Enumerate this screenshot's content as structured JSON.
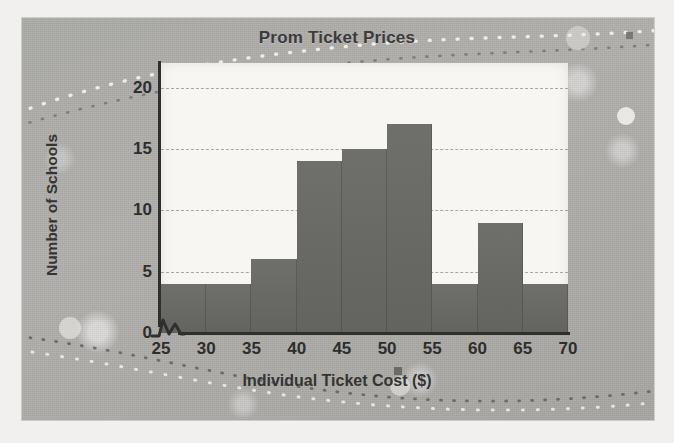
{
  "chart_data": {
    "type": "bar",
    "title": "Prom Ticket Prices",
    "xlabel": "Individual Ticket Cost ($)",
    "ylabel": "Number of Schools",
    "categories": [
      "25-30",
      "30-35",
      "35-40",
      "40-45",
      "45-50",
      "50-55",
      "55-60",
      "60-65",
      "65-70"
    ],
    "bin_edges": [
      25,
      30,
      35,
      40,
      45,
      50,
      55,
      60,
      65,
      70
    ],
    "values": [
      4,
      4,
      6,
      14,
      15,
      17,
      4,
      9,
      4
    ],
    "xlim": [
      25,
      70
    ],
    "ylim": [
      0,
      22
    ],
    "xticks": [
      25,
      30,
      35,
      40,
      45,
      50,
      55,
      60,
      65,
      70
    ],
    "yticks": [
      0,
      5,
      10,
      15,
      20
    ],
    "grid": true,
    "grid_axis": "y",
    "legend": null,
    "x_axis_break": true,
    "bar_color": "#68686 5",
    "plot_background": "#f7f6f2"
  },
  "style": {
    "bar_color": "#696966",
    "axis_color": "#2f2f2e",
    "grid_color": "#9a9a96",
    "text_color": "#2e2e2d",
    "card_color": "#b0afac"
  },
  "icons": {
    "axis_break": "zigzag-break-icon"
  }
}
